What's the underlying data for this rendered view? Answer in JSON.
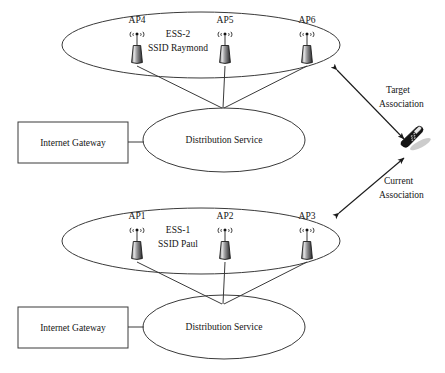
{
  "diagram": {
    "background_color": "#ffffff",
    "line_color": "#3a3a3a",
    "text_color": "#151515"
  },
  "upper_ess": {
    "name": "ESS-2",
    "ssid_label": "SSID Raymond",
    "access_points": [
      {
        "id": "ap4",
        "label": "AP4",
        "icon": "access-point-icon",
        "signal": "((φ))"
      },
      {
        "id": "ap5",
        "label": "AP5",
        "icon": "access-point-icon",
        "signal": "((φ))"
      },
      {
        "id": "ap6",
        "label": "AP6",
        "icon": "access-point-icon",
        "signal": "((φ))"
      }
    ],
    "distribution_service": "Distribution Service",
    "internet_gateway": "Internet Gateway"
  },
  "lower_ess": {
    "name": "ESS-1",
    "ssid_label": "SSID Paul",
    "access_points": [
      {
        "id": "ap1",
        "label": "AP1",
        "icon": "access-point-icon",
        "signal": "((φ))"
      },
      {
        "id": "ap2",
        "label": "AP2",
        "icon": "access-point-icon",
        "signal": "((φ))"
      },
      {
        "id": "ap3",
        "label": "AP3",
        "icon": "access-point-icon",
        "signal": "((φ))"
      }
    ],
    "distribution_service": "Distribution Service",
    "internet_gateway": "Internet Gateway"
  },
  "associations": {
    "target": {
      "line1": "Target",
      "line2": "Association",
      "arrow": "double-headed"
    },
    "current": {
      "line1": "Current",
      "line2": "Association",
      "arrow": "double-headed"
    }
  },
  "mobile_station": {
    "icon": "mobile-phone-icon",
    "label": ""
  }
}
